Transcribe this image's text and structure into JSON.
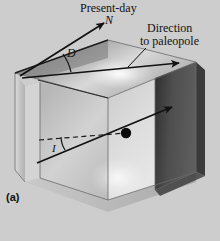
{
  "figure": {
    "panel_label": "(a)",
    "background_color": "#cdcdcd",
    "ink_color": "#111111",
    "labels": {
      "present_day": "Present-day",
      "north": "N",
      "direction_line1": "Direction",
      "direction_line2": "to paleopole",
      "declination": "D",
      "inclination": "I"
    },
    "faces": {
      "top_face_color": "#b9b9b9",
      "top_face_shadow_color": "#8e8e8e",
      "left_face_color": "#c3c3c3",
      "front_face_color": "#d5d5d5",
      "right_face_color": "#4a4a4a",
      "inner_plane_color": "#cfcfcf"
    },
    "annotations": {
      "dot_label": "sample-point",
      "declination_arc": "angle between present-day north and paleopole direction",
      "inclination_arc": "angle between horizontal dashed line and paleopole direction"
    }
  }
}
